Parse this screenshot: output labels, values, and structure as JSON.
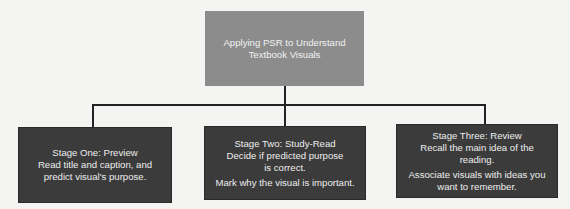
{
  "root": {
    "title_line1": "Applying PSR to Understand",
    "title_line2": "Textbook Visuals",
    "color": "#8c8c8c"
  },
  "stages": [
    {
      "title": "Stage One: Preview",
      "paragraphs": [
        "Read title and caption, and predict visual's purpose."
      ]
    },
    {
      "title": "Stage Two: Study-Read",
      "paragraphs": [
        "Decide if predicted purpose is correct.",
        "Mark why the visual is important."
      ]
    },
    {
      "title": "Stage Three: Review",
      "paragraphs": [
        "Recall the main idea of the reading.",
        "Associate visuals with ideas you want to remember."
      ]
    }
  ],
  "stage_color": "#3b3b3b",
  "connector_color": "#222222"
}
